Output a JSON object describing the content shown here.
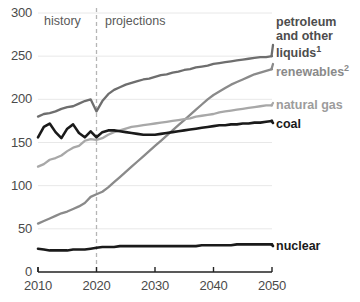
{
  "chart_data": {
    "type": "line",
    "title": "",
    "xlabel": "",
    "ylabel": "",
    "xlim": [
      2010,
      2050
    ],
    "ylim": [
      0,
      300
    ],
    "grid": true,
    "legend_position": "right-inline",
    "xticks": [
      "2010",
      "2020",
      "2030",
      "2040",
      "2050"
    ],
    "yticks": [
      "0",
      "50",
      "100",
      "150",
      "200",
      "250",
      "300"
    ],
    "annotations": [
      {
        "text": "history",
        "x": 2015
      },
      {
        "text": "projections",
        "x": 2027
      },
      {
        "text": "divider",
        "x": 2020,
        "style": "dashed-vertical"
      }
    ],
    "x": [
      2010,
      2011,
      2012,
      2013,
      2014,
      2015,
      2016,
      2017,
      2018,
      2019,
      2020,
      2021,
      2022,
      2023,
      2024,
      2025,
      2026,
      2027,
      2028,
      2029,
      2030,
      2031,
      2032,
      2033,
      2034,
      2035,
      2036,
      2037,
      2038,
      2039,
      2040,
      2041,
      2042,
      2043,
      2044,
      2045,
      2046,
      2047,
      2048,
      2049,
      2050
    ],
    "series": [
      {
        "name": "petroleum and other liquids",
        "label": "petroleum and other liquids",
        "superscript": "1",
        "color": "#6e6e6e",
        "values": [
          180,
          183,
          184,
          186,
          189,
          191,
          192,
          195,
          198,
          200,
          186,
          198,
          206,
          211,
          214,
          217,
          219,
          221,
          223,
          224,
          226,
          228,
          229,
          231,
          232,
          234,
          235,
          237,
          238,
          239,
          241,
          242,
          243,
          244,
          245,
          246,
          247,
          248,
          249,
          249,
          250
        ]
      },
      {
        "name": "renewables",
        "label": "renewables",
        "superscript": "2",
        "color": "#8a8a8a",
        "values": [
          56,
          59,
          62,
          65,
          68,
          70,
          73,
          76,
          80,
          87,
          90,
          93,
          98,
          104,
          110,
          116,
          122,
          128,
          134,
          140,
          146,
          152,
          158,
          164,
          170,
          176,
          182,
          188,
          194,
          200,
          205,
          209,
          213,
          217,
          220,
          223,
          226,
          229,
          231,
          233,
          235
        ]
      },
      {
        "name": "natural gas",
        "label": "natural gas",
        "superscript": "",
        "color": "#a8a8a8",
        "values": [
          122,
          125,
          130,
          132,
          135,
          140,
          144,
          146,
          152,
          154,
          153,
          155,
          159,
          162,
          164,
          166,
          168,
          169,
          170,
          171,
          172,
          173,
          174,
          175,
          176,
          177,
          178,
          180,
          181,
          182,
          183,
          185,
          186,
          187,
          188,
          189,
          190,
          191,
          192,
          193,
          193
        ]
      },
      {
        "name": "coal",
        "label": "coal",
        "superscript": "",
        "color": "#1a1a1a",
        "values": [
          156,
          168,
          172,
          162,
          155,
          166,
          171,
          161,
          156,
          163,
          156,
          162,
          164,
          164,
          163,
          162,
          161,
          160,
          159,
          159,
          159,
          160,
          161,
          162,
          163,
          164,
          165,
          166,
          167,
          168,
          169,
          170,
          170,
          171,
          171,
          172,
          172,
          173,
          173,
          174,
          175
        ]
      },
      {
        "name": "nuclear",
        "label": "nuclear",
        "superscript": "",
        "color": "#1a1a1a",
        "values": [
          27,
          26,
          25,
          25,
          25,
          25,
          26,
          26,
          26,
          27,
          28,
          29,
          29,
          29,
          30,
          30,
          30,
          30,
          30,
          30,
          30,
          30,
          30,
          30,
          30,
          30,
          30,
          30,
          31,
          31,
          31,
          31,
          31,
          31,
          32,
          32,
          32,
          32,
          32,
          32,
          32
        ]
      }
    ]
  },
  "labels": {
    "history": "history",
    "projections": "projections",
    "petroleum_line1": "petroleum",
    "petroleum_line2": "and other",
    "petroleum_line3": "liquids",
    "petroleum_sup": "1",
    "renewables": "renewables",
    "renewables_sup": "2",
    "natural_gas": "natural gas",
    "coal": "coal",
    "nuclear": "nuclear"
  },
  "colors": {
    "petroleum": "#6e6e6e",
    "renewables": "#8a8a8a",
    "natural_gas": "#a8a8a8",
    "coal": "#1a1a1a",
    "nuclear": "#1a1a1a",
    "axis": "#222222",
    "grid": "#e8e8e8",
    "divider": "#b5b5b5",
    "tick_text": "#4a4a4a"
  }
}
